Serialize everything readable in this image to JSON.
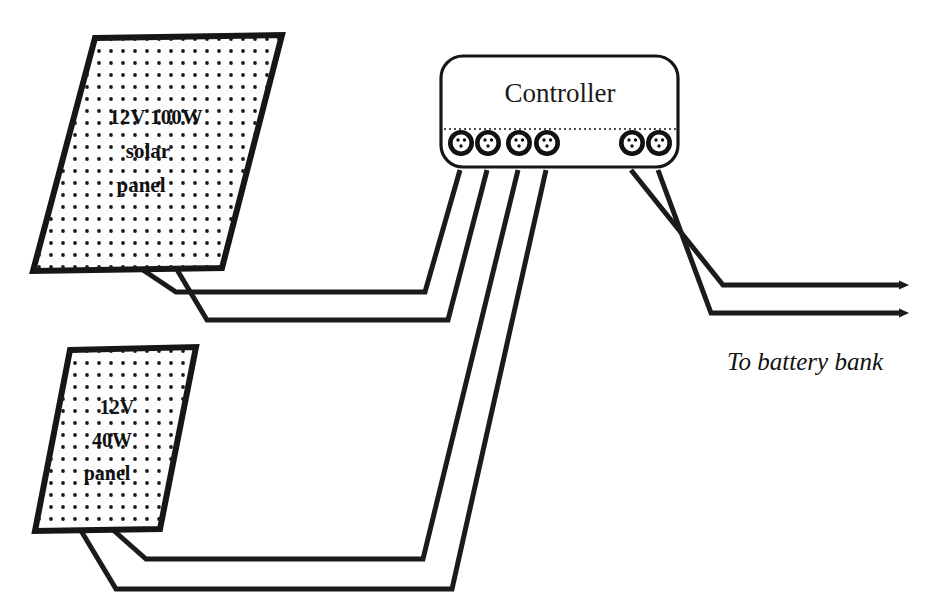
{
  "diagram": {
    "background_color": "#ffffff",
    "ink_color": "#161616"
  },
  "panels": [
    {
      "id": "panel-100w",
      "line1": "12V 100W",
      "line2": "solar",
      "line3": "panel",
      "fill_color": "#fdfdfd",
      "border_color": "#161616"
    },
    {
      "id": "panel-40w",
      "line1": "12V",
      "line2": "40W",
      "line3": "panel",
      "fill_color": "#fdfdfd",
      "border_color": "#161616"
    }
  ],
  "controller": {
    "label": "Controller",
    "terminal_count": 6,
    "left_group_count": 4,
    "right_group_count": 2,
    "fill_color": "#ffffff",
    "border_color": "#161616"
  },
  "output": {
    "label": "To battery bank",
    "arrow_count": 2
  },
  "wires": {
    "color": "#1b1b1b",
    "count": 6
  }
}
